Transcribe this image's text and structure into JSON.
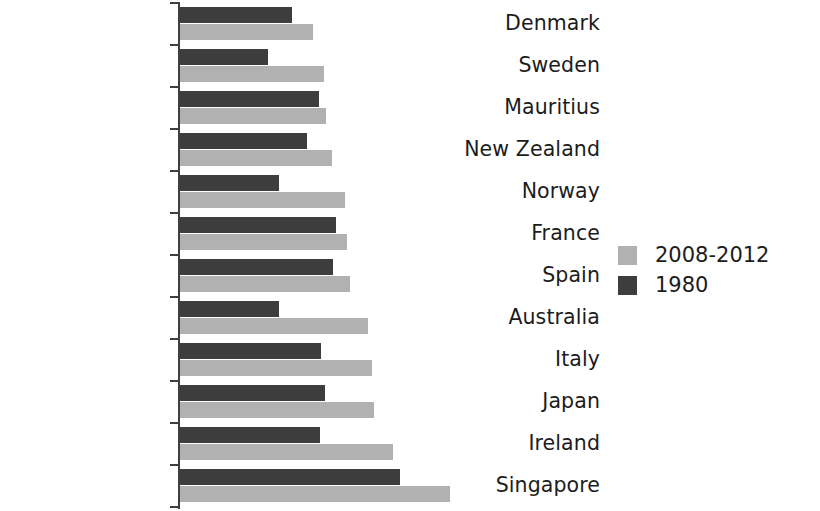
{
  "chart_data": {
    "type": "bar",
    "orientation": "horizontal",
    "title": "",
    "subtitle": "",
    "xlabel": "",
    "ylabel": "",
    "grid": false,
    "legend_position": "right",
    "xlim": [
      70,
      84
    ],
    "axis_visible": true,
    "categories": [
      "Denmark",
      "Sweden",
      "Mauritius",
      "New Zealand",
      "Norway",
      "France",
      "Spain",
      "Australia",
      "Italy",
      "Japan",
      "Ireland",
      "Singapore"
    ],
    "series": [
      {
        "name": "2008-2012",
        "color": "#b1b1b1",
        "values": [
          79.3,
          79.8,
          79.9,
          80.2,
          80.8,
          80.9,
          81.0,
          81.6,
          81.8,
          81.9,
          82.5,
          84.4
        ],
        "pixel_lengths": [
          133,
          144,
          146,
          152,
          165,
          167,
          170,
          188,
          192,
          194,
          213,
          270
        ]
      },
      {
        "name": "1980",
        "color": "#3d3d3d",
        "values": [
          74.3,
          73.5,
          74.8,
          74.4,
          73.6,
          75.1,
          75.0,
          73.6,
          74.7,
          74.8,
          74.6,
          77.1
        ],
        "pixel_lengths": [
          112,
          88,
          139,
          127,
          99,
          156,
          153,
          99,
          141,
          145,
          140,
          220
        ]
      }
    ]
  },
  "legend": {
    "items": [
      {
        "label": "2008-2012",
        "swatch": "legend-swatch-light",
        "color": "#b1b1b1"
      },
      {
        "label": "1980",
        "swatch": "legend-swatch-dark",
        "color": "#3d3d3d"
      }
    ]
  }
}
